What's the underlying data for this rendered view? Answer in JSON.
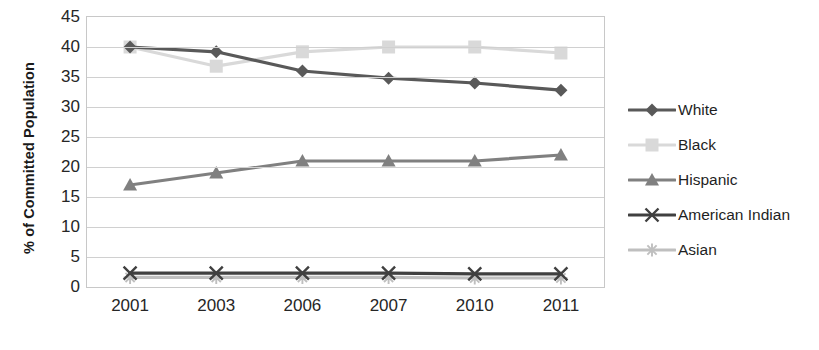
{
  "chart_data": {
    "type": "line",
    "title": "",
    "xlabel": "",
    "ylabel": "% of Committed Population",
    "categories": [
      "2001",
      "2003",
      "2006",
      "2007",
      "2010",
      "2011"
    ],
    "ylim": [
      0,
      45
    ],
    "yticks": [
      0,
      5,
      10,
      15,
      20,
      25,
      30,
      35,
      40,
      45
    ],
    "grid": true,
    "legend_position": "right",
    "series": [
      {
        "name": "White",
        "marker": "diamond",
        "color": "#595959",
        "values": [
          40.0,
          39.2,
          36.0,
          34.8,
          34.0,
          32.8
        ]
      },
      {
        "name": "Black",
        "marker": "square",
        "color": "#d9d9d9",
        "values": [
          40.0,
          36.8,
          39.2,
          40.0,
          40.0,
          39.0
        ]
      },
      {
        "name": "Hispanic",
        "marker": "triangle",
        "color": "#808080",
        "values": [
          17.0,
          19.0,
          21.0,
          21.0,
          21.0,
          22.0
        ]
      },
      {
        "name": "American Indian",
        "marker": "cross",
        "color": "#404040",
        "values": [
          2.3,
          2.3,
          2.3,
          2.3,
          2.2,
          2.2
        ]
      },
      {
        "name": "Asian",
        "marker": "star",
        "color": "#bfbfbf",
        "values": [
          1.6,
          1.6,
          1.6,
          1.6,
          1.5,
          1.5
        ]
      }
    ]
  },
  "axes": {
    "ylabel_text": "% of Committed Population",
    "ytick_labels": [
      "45",
      "40",
      "35",
      "30",
      "25",
      "20",
      "15",
      "10",
      "5",
      "0"
    ],
    "xtick_labels": [
      "2001",
      "2003",
      "2006",
      "2007",
      "2010",
      "2011"
    ]
  },
  "legend": {
    "items": [
      {
        "label": "White"
      },
      {
        "label": "Black"
      },
      {
        "label": "Hispanic"
      },
      {
        "label": "American Indian"
      },
      {
        "label": "Asian"
      }
    ]
  }
}
